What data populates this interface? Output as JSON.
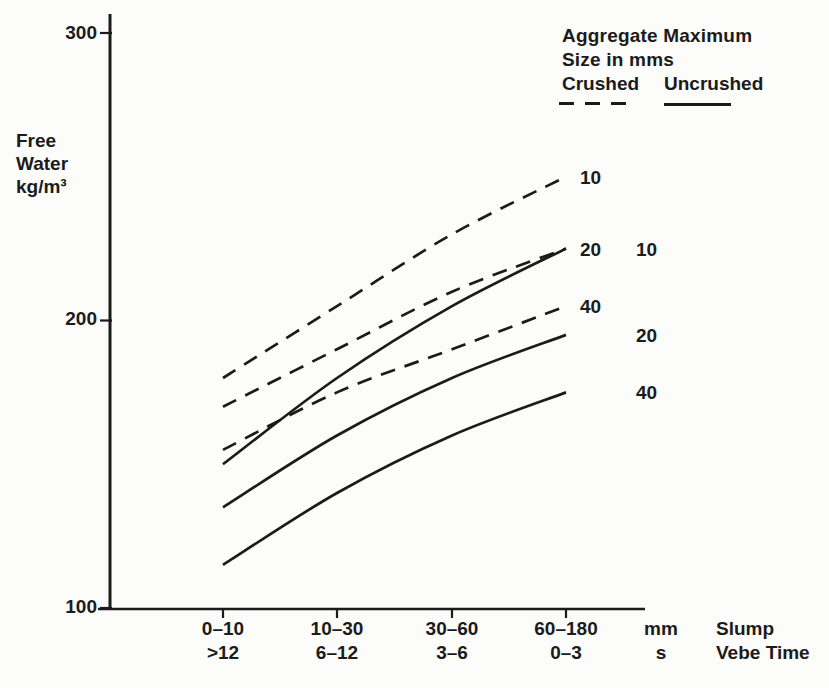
{
  "figure": {
    "background": "#fcfcfa",
    "ink": "#1b1b1b"
  },
  "chart_data": {
    "type": "line",
    "title": "",
    "ylabel_lines": [
      "Free",
      "Water",
      "kg/m³"
    ],
    "ylabel_unit_sup": "3",
    "y_ticks": [
      100,
      200,
      300
    ],
    "ylim": [
      100,
      310
    ],
    "grid": false,
    "legend_position": "top-right",
    "x_axis": {
      "slump_categories": [
        "0–10",
        "10–30",
        "30–60",
        "60–180"
      ],
      "vebe_categories": [
        ">12",
        "6–12",
        "3–6",
        "0–3"
      ],
      "slump_unit": "mm",
      "vebe_unit": "s",
      "slump_name": "Slump",
      "vebe_name": "Vebe Time"
    },
    "legend": {
      "line1": "Aggregate Maximum",
      "line2": "Size in mms",
      "crushed_label": "Crushed",
      "uncrushed_label": "Uncrushed"
    },
    "series": [
      {
        "name": "crushed-10mm",
        "group": "Crushed",
        "style": "dashed",
        "label": "10",
        "values": [
          180,
          205,
          230,
          250
        ]
      },
      {
        "name": "crushed-20mm",
        "group": "Crushed",
        "style": "dashed",
        "label": "20",
        "values": [
          170,
          190,
          210,
          225
        ]
      },
      {
        "name": "crushed-40mm",
        "group": "Crushed",
        "style": "dashed",
        "label": "40",
        "values": [
          155,
          175,
          190,
          205
        ]
      },
      {
        "name": "uncrushed-10mm",
        "group": "Uncrushed",
        "style": "solid",
        "label": "10",
        "values": [
          150,
          180,
          205,
          225
        ]
      },
      {
        "name": "uncrushed-20mm",
        "group": "Uncrushed",
        "style": "solid",
        "label": "20",
        "values": [
          135,
          160,
          180,
          195
        ]
      },
      {
        "name": "uncrushed-40mm",
        "group": "Uncrushed",
        "style": "solid",
        "label": "40",
        "values": [
          115,
          140,
          160,
          175
        ]
      }
    ]
  }
}
